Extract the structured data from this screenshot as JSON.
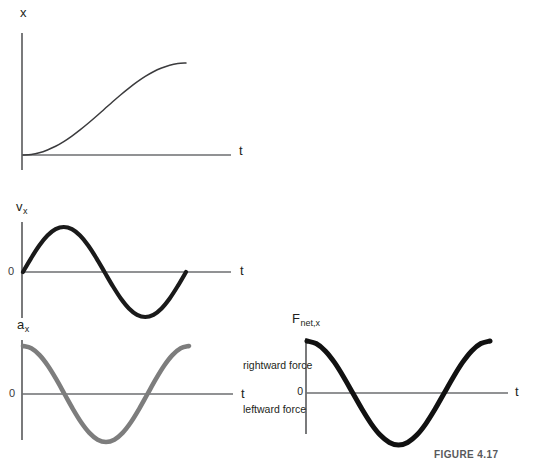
{
  "figure": {
    "caption": "FIGURE 4.17",
    "width": 537,
    "height": 459,
    "background": "#ffffff"
  },
  "colors": {
    "position_curve": "#3b3b3d",
    "velocity_curve": "#1a1a1a",
    "acceleration_curve": "#7d7d7d",
    "force_curve": "#111111",
    "axis": "#6d6e71",
    "text": "#231f20"
  },
  "panels": [
    {
      "id": "position",
      "y_axis_label": "x",
      "y_axis_subscript": "",
      "x_axis_label": "t",
      "zero_label": "",
      "curve_style": "thin-dark",
      "description": "position versus time, single smooth hump starting and ending at zero"
    },
    {
      "id": "velocity",
      "y_axis_label": "v",
      "y_axis_subscript": "x",
      "x_axis_label": "t",
      "zero_label": "0",
      "curve_style": "thick-black",
      "description": "velocity versus time, one full sine cycle positive then negative"
    },
    {
      "id": "acceleration",
      "y_axis_label": "a",
      "y_axis_subscript": "x",
      "x_axis_label": "t",
      "zero_label": "0",
      "curve_style": "thick-gray",
      "description": "acceleration versus time, cosine shape starting at positive maximum"
    },
    {
      "id": "net-force",
      "y_axis_label": "F",
      "y_axis_subscript": "net,x",
      "x_axis_label": "t",
      "zero_label": "0",
      "positive_label": "rightward force",
      "negative_label": "leftward force",
      "curve_style": "thick-black",
      "description": "net force versus time, same cosine shape as acceleration"
    }
  ],
  "chart_data": {
    "type": "line",
    "title": "",
    "xlabel": "t",
    "ylabel": "",
    "grid": false,
    "legend": "none",
    "x": [
      0.0,
      0.05,
      0.1,
      0.15,
      0.2,
      0.25,
      0.3,
      0.35,
      0.4,
      0.45,
      0.5,
      0.55,
      0.6,
      0.65,
      0.7,
      0.75,
      0.8,
      0.85,
      0.9,
      0.95,
      1.0
    ],
    "series": [
      {
        "name": "x",
        "panel": "position",
        "ylabel": "x",
        "ylim": [
          0,
          1.1
        ],
        "values": [
          0.0,
          0.006,
          0.024,
          0.055,
          0.095,
          0.146,
          0.206,
          0.273,
          0.345,
          0.421,
          0.5,
          0.579,
          0.655,
          0.727,
          0.794,
          0.854,
          0.905,
          0.945,
          0.976,
          0.994,
          1.0
        ]
      },
      {
        "name": "v_x",
        "panel": "velocity",
        "ylabel": "v_x",
        "ylim": [
          -1.1,
          1.1
        ],
        "values": [
          0.0,
          0.309,
          0.588,
          0.809,
          0.951,
          1.0,
          0.951,
          0.809,
          0.588,
          0.309,
          0.0,
          -0.309,
          -0.588,
          -0.809,
          -0.951,
          -1.0,
          -0.951,
          -0.809,
          -0.588,
          -0.309,
          0.0
        ]
      },
      {
        "name": "a_x",
        "panel": "acceleration",
        "ylabel": "a_x",
        "ylim": [
          -1.1,
          1.1
        ],
        "values": [
          1.0,
          0.951,
          0.809,
          0.588,
          0.309,
          0.0,
          -0.309,
          -0.588,
          -0.809,
          -0.951,
          -1.0,
          -0.951,
          -0.809,
          -0.588,
          -0.309,
          0.0,
          0.309,
          0.588,
          0.809,
          0.951,
          1.0
        ]
      },
      {
        "name": "F_net,x",
        "panel": "net-force",
        "ylabel": "F_net,x",
        "ylim": [
          -1.1,
          1.1
        ],
        "values": [
          1.0,
          0.951,
          0.809,
          0.588,
          0.309,
          0.0,
          -0.309,
          -0.588,
          -0.809,
          -0.951,
          -1.0,
          -0.951,
          -0.809,
          -0.588,
          -0.309,
          0.0,
          0.309,
          0.588,
          0.809,
          0.951,
          1.0
        ]
      }
    ]
  }
}
